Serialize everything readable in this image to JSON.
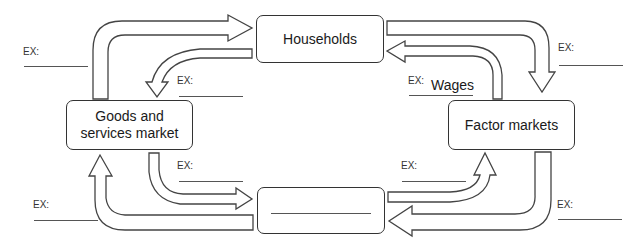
{
  "boxes": {
    "households": "Households",
    "goods_services": "Goods and\nservices market",
    "factor_markets": "Factor markets",
    "blank_firms": ""
  },
  "labels": {
    "ex": "EX:",
    "wages": "Wages"
  },
  "ex_labels": [
    {
      "id": "top-left-outer",
      "text": "EX:"
    },
    {
      "id": "top-left-inner",
      "text": "EX:"
    },
    {
      "id": "top-right-outer",
      "text": "EX:"
    },
    {
      "id": "top-right-inner",
      "text": "EX:",
      "answer": "Wages"
    },
    {
      "id": "bottom-left-inner",
      "text": "EX:"
    },
    {
      "id": "bottom-left-outer",
      "text": "EX:"
    },
    {
      "id": "bottom-right-inner",
      "text": "EX:"
    },
    {
      "id": "bottom-right-outer",
      "text": "EX:"
    }
  ],
  "colors": {
    "stroke": "#333333",
    "background": "#ffffff"
  }
}
